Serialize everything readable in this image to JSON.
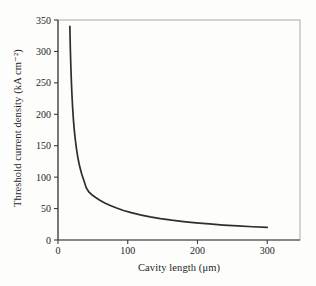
{
  "figure": {
    "background": "#fdfdfb",
    "frame_color": "#a9a9a6",
    "axis_color": "#3c3c3c",
    "tick_label_color": "#1e1e1e",
    "curve_color": "#2e2e2e"
  },
  "chart_data": {
    "type": "line",
    "title": "",
    "xlabel": "Cavity length (μm)",
    "ylabel": "Threshold current density (kA cm⁻²)",
    "xlim": [
      0,
      347
    ],
    "ylim": [
      0,
      350
    ],
    "x_ticks": [
      0,
      100,
      200,
      300
    ],
    "y_ticks": [
      0,
      50,
      100,
      150,
      200,
      250,
      300,
      350
    ],
    "grid": false,
    "legend": "none",
    "series": [
      {
        "name": "threshold-current-density-vs-cavity-length",
        "x": [
          17,
          17.4,
          17.9,
          18.5,
          19.2,
          20,
          21,
          22.2,
          23.6,
          25.2,
          27,
          29,
          31.3,
          34,
          37,
          40.5,
          44.5,
          49,
          54,
          60,
          67,
          75,
          84,
          94,
          105,
          118,
          132,
          147,
          163,
          180,
          198,
          217,
          237,
          258,
          279,
          300
        ],
        "y": [
          340,
          318,
          296,
          274,
          252,
          231,
          210,
          190,
          172,
          156,
          141,
          128,
          116,
          105,
          95,
          83,
          76,
          71.6,
          67.6,
          63.3,
          59,
          54.8,
          50.8,
          47,
          43.5,
          40,
          36.8,
          34,
          31.5,
          29.3,
          27.3,
          25.5,
          23.8,
          22.4,
          21.1,
          20
        ]
      }
    ]
  }
}
